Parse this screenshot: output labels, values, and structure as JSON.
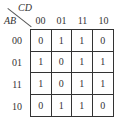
{
  "kmap": {
    "col_var": "CD",
    "row_var": "AB",
    "col_headers": [
      "00",
      "01",
      "11",
      "10"
    ],
    "row_headers": [
      "00",
      "01",
      "11",
      "10"
    ],
    "cells": [
      [
        "0",
        "1",
        "1",
        "0"
      ],
      [
        "1",
        "0",
        "1",
        "1"
      ],
      [
        "1",
        "0",
        "1",
        "1"
      ],
      [
        "0",
        "1",
        "1",
        "0"
      ]
    ]
  }
}
